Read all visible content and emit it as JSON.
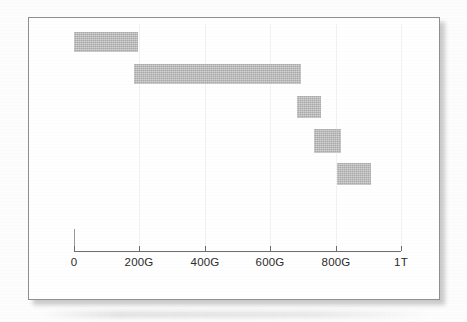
{
  "figure": {
    "kind": "range-bar-chart",
    "caption": "",
    "frame_color": "#8f8f8f",
    "bar_color": "#a9a9a9",
    "axis_color": "#6e6e6e",
    "background": "#ffffff"
  },
  "chart_data": {
    "type": "bar",
    "orientation": "horizontal",
    "subtype": "range-bar",
    "title": "",
    "xlabel": "",
    "ylabel": "",
    "grid": true,
    "legend": null,
    "xlim": [
      0,
      1000
    ],
    "x_unit": "G",
    "x_tick_values": [
      0,
      200,
      400,
      600,
      800,
      1000
    ],
    "x_tick_labels": [
      "0",
      "200G",
      "400G",
      "600G",
      "800G",
      "1T"
    ],
    "categories": [
      "range-1",
      "range-2",
      "range-3",
      "range-4",
      "range-5"
    ],
    "bars": [
      {
        "name": "range-1",
        "start": 0,
        "end": 196,
        "start_label": "0",
        "end_label": "196G"
      },
      {
        "name": "range-2",
        "start": 184,
        "end": 694,
        "start_label": "184G",
        "end_label": "694G"
      },
      {
        "name": "range-3",
        "start": 682,
        "end": 756,
        "start_label": "682G",
        "end_label": "756G"
      },
      {
        "name": "range-4",
        "start": 734,
        "end": 817,
        "start_label": "734G",
        "end_label": "817G"
      },
      {
        "name": "range-5",
        "start": 805,
        "end": 908,
        "start_label": "805G",
        "end_label": "908G"
      }
    ],
    "values": [
      196,
      510,
      74,
      83,
      103
    ]
  }
}
